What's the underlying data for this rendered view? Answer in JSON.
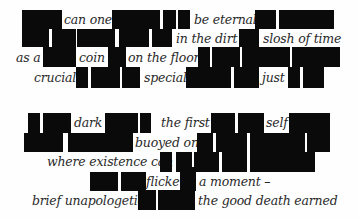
{
  "poem": {
    "type": "blackout-poem",
    "redaction_color": "#0a0a0a",
    "text_color": "#2a2a2a",
    "stanzas": [
      {
        "lines": [
          [
            "can one",
            "be eternal"
          ],
          [
            "in the dirt",
            "slosh of time"
          ],
          [
            "as a",
            "coin",
            "on the floor"
          ],
          [
            "crucial",
            "special",
            "just"
          ]
        ]
      },
      {
        "lines": [
          [
            "dark",
            "the first",
            "self"
          ],
          [
            "buoyed on"
          ],
          [
            "where existence can"
          ],
          [
            "flicker",
            "a moment –"
          ],
          [
            "brief unapologetic",
            "the good death earned"
          ]
        ]
      }
    ]
  }
}
